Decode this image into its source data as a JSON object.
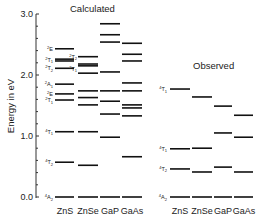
{
  "chart_data": {
    "type": "energy-level-diagram",
    "ylabel": "Energy in eV",
    "ylim": [
      0.0,
      3.0
    ],
    "yticks": [
      "0.0",
      "1.0",
      "2.0",
      "3.0"
    ],
    "grid": false,
    "panels": [
      {
        "title": "Calculated",
        "categories": [
          "ZnS",
          "ZnSe",
          "GaP",
          "GaAs"
        ],
        "state_labels": [
          {
            "label": "4A2",
            "energy": 0.0
          },
          {
            "label": "4T2",
            "energy": 0.57
          },
          {
            "label": "4T1",
            "energy": 1.07
          },
          {
            "label": "2T1",
            "energy": 1.59
          },
          {
            "label": "2E",
            "energy": 1.69
          },
          {
            "label": "2A1",
            "energy": 1.85
          },
          {
            "label": "2T2",
            "energy": 2.11
          },
          {
            "label": "2T1",
            "energy": 2.25
          },
          {
            "label": "2E",
            "energy": 2.43
          }
        ],
        "znse_state_labels": [
          {
            "label": "2T2",
            "energy": 2.3
          },
          {
            "label": "2T1",
            "energy": 2.1
          }
        ],
        "series": [
          {
            "name": "ZnS",
            "values": [
              0.0,
              0.57,
              1.07,
              1.59,
              1.69,
              1.85,
              2.11,
              2.23,
              2.26,
              2.43
            ]
          },
          {
            "name": "ZnSe",
            "values": [
              0.0,
              0.52,
              1.07,
              1.51,
              1.63,
              1.74,
              2.03,
              2.15,
              2.18,
              2.3
            ]
          },
          {
            "name": "GaP",
            "values": [
              0.0,
              0.98,
              1.36,
              1.57,
              1.74,
              2.05,
              2.54,
              2.66,
              2.84
            ]
          },
          {
            "name": "GaAs",
            "values": [
              0.0,
              0.66,
              1.33,
              1.46,
              1.51,
              1.74,
              1.87,
              2.23,
              2.34,
              2.52
            ]
          }
        ]
      },
      {
        "title": "Observed",
        "categories": [
          "ZnS",
          "ZnSe",
          "GaP",
          "GaAs"
        ],
        "state_labels": [
          {
            "label": "4A2",
            "energy": 0.0
          },
          {
            "label": "4T2",
            "energy": 0.46
          },
          {
            "label": "4T1",
            "energy": 0.79
          },
          {
            "label": "4T1",
            "energy": 1.77
          }
        ],
        "series": [
          {
            "name": "ZnS",
            "values": [
              0.0,
              0.46,
              0.79,
              1.77
            ]
          },
          {
            "name": "ZnSe",
            "values": [
              0.0,
              0.41,
              0.8,
              1.64
            ]
          },
          {
            "name": "GaP",
            "values": [
              0.0,
              0.49,
              1.05,
              1.49
            ]
          },
          {
            "name": "GaAs",
            "values": [
              0.0,
              0.41,
              0.98,
              1.34
            ]
          }
        ]
      }
    ]
  },
  "labels": {
    "ylabel": "Energy in eV",
    "calc_title": "Calculated",
    "obs_title": "Observed",
    "tick_0": "0.0",
    "tick_1": "1.0",
    "tick_2": "2.0",
    "tick_3": "3.0",
    "calc_cols": [
      "ZnS",
      "ZnSe",
      "GaP",
      "GaAs"
    ],
    "obs_cols": [
      "ZnS",
      "ZnSe",
      "GaP",
      "GaAs"
    ]
  }
}
